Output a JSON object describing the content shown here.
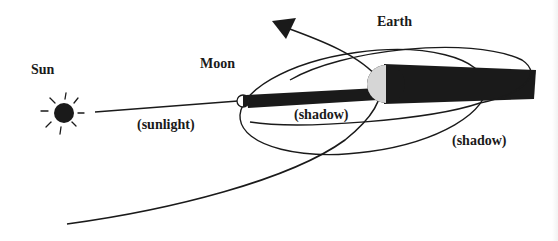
{
  "diagram": {
    "labels": {
      "sun": "Sun",
      "moon": "Moon",
      "earth": "Earth",
      "sunlight": "(sunlight)",
      "moon_shadow": "(shadow)",
      "earth_shadow": "(shadow)"
    },
    "colors": {
      "ink": "#1a1a1a",
      "background": "#ffffff",
      "earth_lit_side": "#d6d6d6"
    }
  }
}
